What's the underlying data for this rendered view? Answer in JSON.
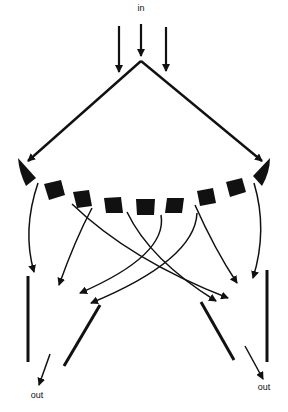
{
  "diagram": {
    "labels": {
      "input": "in",
      "output_left": "out",
      "output_right": "out"
    },
    "colors": {
      "ink": "#111111",
      "background": "#ffffff"
    },
    "components": {
      "input_arrows": 3,
      "reflector_blocks": 7,
      "end_wedges": 2,
      "crossing_arrows": 8,
      "output_mirrors": 4,
      "output_arrows": 2
    }
  }
}
